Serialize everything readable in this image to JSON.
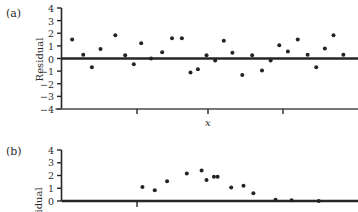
{
  "figure": {
    "panels": [
      {
        "id": "panel-a",
        "label": "(a)",
        "ylabel": "Residual",
        "xlabel": "x",
        "ytick_labels": [
          "4",
          "3",
          "2",
          "1",
          "0",
          "−1",
          "−2",
          "−3",
          "−4"
        ]
      },
      {
        "id": "panel-b",
        "label": "(b)",
        "ylabel": "sidual",
        "xlabel": "",
        "ytick_labels": [
          "4",
          "3",
          "2",
          "1",
          "0"
        ]
      }
    ]
  },
  "chart_data": [
    {
      "type": "scatter",
      "title": "(a)",
      "xlabel": "x",
      "ylabel": "Residual",
      "ylim": [
        -4,
        4
      ],
      "yticks": [
        4,
        3,
        2,
        1,
        0,
        -1,
        -2,
        -3,
        -4
      ],
      "grid": false,
      "legend": "none",
      "zero_reference_line": 0,
      "x": [
        0.5,
        1.4,
        2.1,
        2.8,
        4.0,
        4.8,
        5.5,
        6.1,
        6.9,
        7.8,
        8.6,
        9.4,
        10.1,
        10.7,
        11.4,
        12.1,
        12.8,
        13.5,
        14.3,
        15.1,
        15.9,
        16.6,
        17.3,
        18.0,
        18.8,
        19.6,
        20.3,
        21.0,
        21.7,
        22.5
      ],
      "y": [
        1.5,
        0.3,
        -0.7,
        0.75,
        1.85,
        0.25,
        -0.45,
        1.2,
        0.0,
        0.5,
        1.6,
        1.6,
        -1.1,
        -0.85,
        0.25,
        -0.15,
        1.4,
        0.45,
        -1.3,
        0.25,
        -0.95,
        -0.15,
        1.05,
        0.55,
        1.5,
        0.3,
        -0.7,
        0.8,
        1.85,
        0.3
      ]
    },
    {
      "type": "scatter",
      "title": "(b)",
      "xlabel": "",
      "ylabel": "sidual",
      "ylim": [
        0,
        4
      ],
      "yticks": [
        4,
        3,
        2,
        1,
        0
      ],
      "grid": false,
      "legend": "none",
      "zero_reference_line": 0,
      "x": [
        6.2,
        7.2,
        8.2,
        9.8,
        11.0,
        11.4,
        12.0,
        12.3,
        13.4,
        14.4,
        15.2,
        17.0,
        18.3,
        20.5
      ],
      "y": [
        1.1,
        0.85,
        1.55,
        2.15,
        2.4,
        1.65,
        1.9,
        1.9,
        1.05,
        1.2,
        0.6,
        0.1,
        0.05,
        0.0
      ]
    }
  ]
}
